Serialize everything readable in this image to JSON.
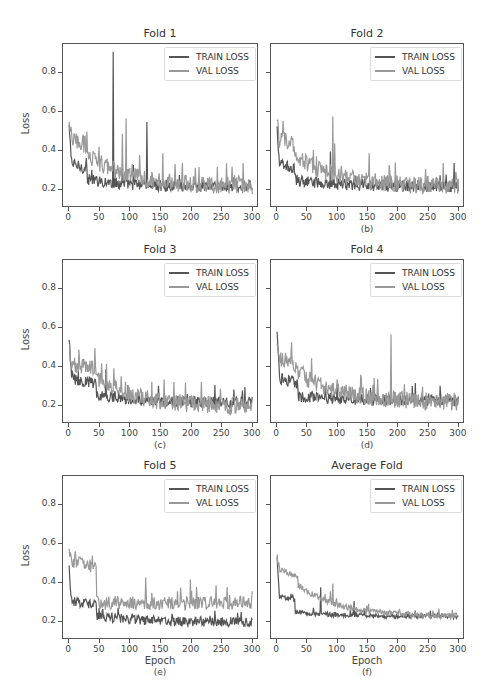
{
  "colors": {
    "train": "#555555",
    "val": "#999999",
    "axes": "#555555"
  },
  "chart_data": [
    {
      "type": "line",
      "title": "Fold 1",
      "sublabel": "(a)",
      "xlabel": "",
      "ylabel": "Loss",
      "xlim": [
        -10,
        310
      ],
      "ylim": [
        0.11,
        0.95
      ],
      "xticks": [
        "0",
        "50",
        "100",
        "150",
        "200",
        "250",
        "300"
      ],
      "yticks": [
        "0.2",
        "0.4",
        "0.6",
        "0.8"
      ],
      "legend": [
        "TRAIN LOSS",
        "VAL LOSS"
      ],
      "legend_position": "upper right",
      "series": [
        {
          "name": "TRAIN LOSS",
          "start": 0.53,
          "plateau": 0.3,
          "plateau_end": 30,
          "end": 0.22,
          "noise": 0.03,
          "spikes": [
            [
              72,
              0.91
            ],
            [
              127,
              0.55
            ],
            [
              87,
              0.33
            ],
            [
              105,
              0.33
            ]
          ]
        },
        {
          "name": "VAL LOSS",
          "start": 0.54,
          "plateau": 0.45,
          "plateau_end": 30,
          "end": 0.22,
          "noise": 0.045,
          "spikes": [
            [
              87,
              0.49
            ],
            [
              93,
              0.57
            ],
            [
              153,
              0.39
            ],
            [
              185,
              0.34
            ],
            [
              212,
              0.32
            ],
            [
              242,
              0.32
            ]
          ]
        }
      ]
    },
    {
      "type": "line",
      "title": "Fold 2",
      "sublabel": "(b)",
      "xlabel": "",
      "ylabel": "",
      "xlim": [
        -10,
        310
      ],
      "ylim": [
        0.11,
        0.95
      ],
      "xticks": [
        "0",
        "50",
        "100",
        "150",
        "200",
        "250",
        "300"
      ],
      "yticks": [
        "",
        "",
        "",
        ""
      ],
      "legend": [
        "TRAIN LOSS",
        "VAL LOSS"
      ],
      "legend_position": "upper right",
      "series": [
        {
          "name": "TRAIN LOSS",
          "start": 0.52,
          "plateau": 0.3,
          "plateau_end": 30,
          "end": 0.22,
          "noise": 0.03,
          "spikes": [
            [
              88,
              0.4
            ],
            [
              292,
              0.34
            ]
          ]
        },
        {
          "name": "VAL LOSS",
          "start": 0.54,
          "plateau": 0.45,
          "plateau_end": 30,
          "end": 0.22,
          "noise": 0.045,
          "spikes": [
            [
              92,
              0.58
            ],
            [
              95,
              0.44
            ],
            [
              152,
              0.39
            ],
            [
              185,
              0.33
            ],
            [
              245,
              0.31
            ]
          ]
        }
      ]
    },
    {
      "type": "line",
      "title": "Fold 3",
      "sublabel": "(c)",
      "xlabel": "",
      "ylabel": "Loss",
      "xlim": [
        -10,
        310
      ],
      "ylim": [
        0.11,
        0.95
      ],
      "xticks": [
        "0",
        "50",
        "100",
        "150",
        "200",
        "250",
        "300"
      ],
      "yticks": [
        "0.2",
        "0.4",
        "0.6",
        "0.8"
      ],
      "legend": [
        "TRAIN LOSS",
        "VAL LOSS"
      ],
      "legend_position": "upper right",
      "series": [
        {
          "name": "TRAIN LOSS",
          "start": 0.53,
          "plateau": 0.31,
          "plateau_end": 45,
          "end": 0.22,
          "noise": 0.03,
          "spikes": [
            [
              60,
              0.39
            ],
            [
              238,
              0.31
            ],
            [
              287,
              0.3
            ]
          ]
        },
        {
          "name": "VAL LOSS",
          "start": 0.5,
          "plateau": 0.41,
          "plateau_end": 45,
          "end": 0.2,
          "noise": 0.045,
          "spikes": [
            [
              50,
              0.36
            ]
          ]
        }
      ]
    },
    {
      "type": "line",
      "title": "Fold 4",
      "sublabel": "(d)",
      "xlabel": "",
      "ylabel": "",
      "xlim": [
        -10,
        310
      ],
      "ylim": [
        0.11,
        0.95
      ],
      "xticks": [
        "0",
        "50",
        "100",
        "150",
        "200",
        "250",
        "300"
      ],
      "yticks": [
        "",
        "",
        "",
        ""
      ],
      "legend": [
        "TRAIN LOSS",
        "VAL LOSS"
      ],
      "legend_position": "upper right",
      "series": [
        {
          "name": "TRAIN LOSS",
          "start": 0.57,
          "plateau": 0.3,
          "plateau_end": 35,
          "end": 0.23,
          "noise": 0.03,
          "spikes": [
            [
              228,
              0.32
            ]
          ]
        },
        {
          "name": "VAL LOSS",
          "start": 0.5,
          "plateau": 0.44,
          "plateau_end": 35,
          "end": 0.22,
          "noise": 0.045,
          "spikes": [
            [
              188,
              0.57
            ],
            [
              70,
              0.33
            ],
            [
              158,
              0.31
            ]
          ]
        }
      ]
    },
    {
      "type": "line",
      "title": "Fold 5",
      "sublabel": "(e)",
      "xlabel": "Epoch",
      "ylabel": "Loss",
      "xlim": [
        -10,
        310
      ],
      "ylim": [
        0.11,
        0.95
      ],
      "xticks": [
        "0",
        "50",
        "100",
        "150",
        "200",
        "250",
        "300"
      ],
      "yticks": [
        "0.2",
        "0.4",
        "0.6",
        "0.8"
      ],
      "legend": [
        "TRAIN LOSS",
        "VAL LOSS"
      ],
      "legend_position": "upper right",
      "series": [
        {
          "name": "TRAIN LOSS",
          "start": 0.48,
          "plateau": 0.28,
          "plateau_end": 45,
          "end": 0.2,
          "noise": 0.025,
          "spikes": [
            [
              55,
              0.27
            ],
            [
              275,
              0.25
            ]
          ]
        },
        {
          "name": "VAL LOSS",
          "start": 0.56,
          "plateau": 0.51,
          "plateau_end": 45,
          "end": 0.3,
          "noise": 0.035,
          "spikes": [
            [
              125,
              0.43
            ],
            [
              198,
              0.42
            ],
            [
              240,
              0.39
            ]
          ]
        }
      ]
    },
    {
      "type": "line",
      "title": "Average Fold",
      "sublabel": "(f)",
      "xlabel": "Epoch",
      "ylabel": "",
      "xlim": [
        -10,
        310
      ],
      "ylim": [
        0.11,
        0.95
      ],
      "xticks": [
        "0",
        "50",
        "100",
        "150",
        "200",
        "250",
        "300"
      ],
      "yticks": [
        "",
        "",
        "",
        ""
      ],
      "legend": [
        "TRAIN LOSS",
        "VAL LOSS"
      ],
      "legend_position": "upper right",
      "series": [
        {
          "name": "TRAIN LOSS",
          "start": 0.53,
          "plateau": 0.3,
          "plateau_end": 30,
          "end": 0.23,
          "noise": 0.012,
          "spikes": [
            [
              72,
              0.38
            ],
            [
              127,
              0.31
            ]
          ]
        },
        {
          "name": "VAL LOSS",
          "start": 0.54,
          "plateau": 0.46,
          "plateau_end": 35,
          "end": 0.23,
          "noise": 0.015,
          "spikes": [
            [
              92,
              0.4
            ],
            [
              88,
              0.36
            ]
          ]
        }
      ]
    }
  ]
}
